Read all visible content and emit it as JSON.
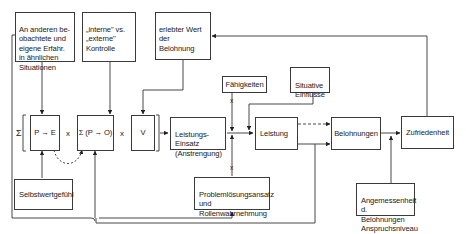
{
  "diagram": {
    "type": "flowchart",
    "language": "de",
    "boxes": {
      "erfahrung": {
        "text": "An anderen be-\nobachtete und\neigene Erfahr.\nin ähnlichen\nSituationen"
      },
      "kontrolle": {
        "text": "„interne\" vs.\n„externe\"\nKontrolle"
      },
      "wert": {
        "text": "erlebter Wert\nder Belohnung"
      },
      "pe": {
        "text": "P → E"
      },
      "po": {
        "text": "Σ (P → O)"
      },
      "v": {
        "text": "V"
      },
      "einsatz": {
        "text": "Leistungs-\nEinsatz\n(Anstrengung)"
      },
      "faehigkeiten": {
        "text": "Fähigkeiten"
      },
      "situative": {
        "text": "Situative\nEinflüsse"
      },
      "leistung": {
        "text": "Leistung"
      },
      "belohnungen": {
        "text": "Belohnungen"
      },
      "zufriedenheit": {
        "text": "Zufriedenheit"
      },
      "selbstwert": {
        "text": "Selbstwertgefühl"
      },
      "problemloesung": {
        "text": "Problemlösungsansatz\nund\nRollenwahrnehmung"
      },
      "angemessenheit": {
        "text": "Angemessenheit d.\nBelohnungen\nAnspruchsniveau"
      }
    },
    "symbols": {
      "sigma": "Σ",
      "times": "x",
      "bracket_open": "[",
      "bracket_close": "]",
      "multiply_marker": "x"
    },
    "edges": [
      {
        "from": "erfahrung",
        "to": "pe",
        "style": "solid"
      },
      {
        "from": "kontrolle",
        "to": "po",
        "style": "solid"
      },
      {
        "from": "wert",
        "to": "v",
        "style": "solid"
      },
      {
        "from": "selbstwert",
        "to": "pe",
        "style": "solid"
      },
      {
        "from": "pe",
        "to": "po",
        "style": "dashed-curve"
      },
      {
        "from": "formula",
        "to": "einsatz",
        "style": "solid"
      },
      {
        "from": "einsatz",
        "to": "leistung",
        "style": "solid"
      },
      {
        "from": "faehigkeiten",
        "to": "leistung",
        "style": "solid",
        "operator": "x"
      },
      {
        "from": "problemloesung",
        "to": "leistung",
        "style": "solid",
        "operator": "x"
      },
      {
        "from": "situative",
        "to": "leistung",
        "style": "solid"
      },
      {
        "from": "leistung",
        "to": "belohnungen",
        "style": "dashed"
      },
      {
        "from": "leistung",
        "to": "belohnungen",
        "style": "solid"
      },
      {
        "from": "belohnungen",
        "to": "zufriedenheit",
        "style": "solid"
      },
      {
        "from": "angemessenheit",
        "to": "zufriedenheit",
        "style": "solid"
      },
      {
        "from": "zufriedenheit",
        "to": "wert",
        "style": "solid",
        "feedback": true
      },
      {
        "from": "leistung",
        "to": "po",
        "style": "solid",
        "feedback": true
      },
      {
        "from": "leistung",
        "to": "problemloesung",
        "style": "solid",
        "feedback": true
      },
      {
        "from": "erfahrung",
        "to": "problemloesung",
        "style": "solid",
        "feedback": true
      }
    ]
  }
}
